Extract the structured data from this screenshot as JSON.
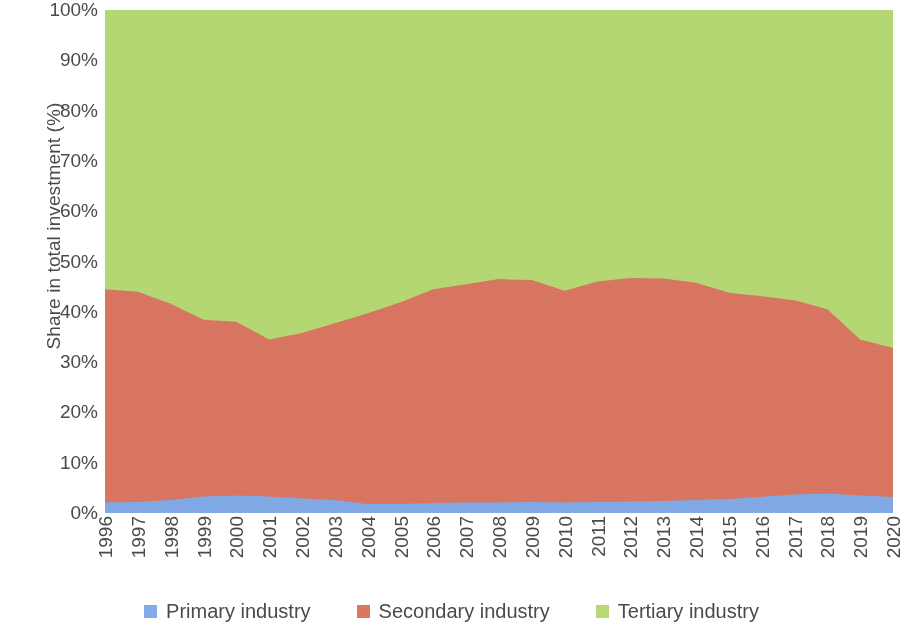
{
  "chart_data": {
    "type": "area",
    "stacked": true,
    "stack_total": 100,
    "title": "",
    "xlabel": "",
    "ylabel": "Share in total investment (%)",
    "ylim": [
      0,
      100
    ],
    "ytick_labels": [
      "0%",
      "10%",
      "20%",
      "30%",
      "40%",
      "50%",
      "60%",
      "70%",
      "80%",
      "90%",
      "100%"
    ],
    "ytick_values": [
      0,
      10,
      20,
      30,
      40,
      50,
      60,
      70,
      80,
      90,
      100
    ],
    "grid": false,
    "legend_position": "bottom",
    "categories": [
      "1996",
      "1997",
      "1998",
      "1999",
      "2000",
      "2001",
      "2002",
      "2003",
      "2004",
      "2005",
      "2006",
      "2007",
      "2008",
      "2009",
      "2010",
      "2011",
      "2012",
      "2013",
      "2014",
      "2015",
      "2016",
      "2017",
      "2018",
      "2019",
      "2020"
    ],
    "series": [
      {
        "name": "Primary industry",
        "color": "#83abe8",
        "values": [
          2.1,
          2.2,
          2.6,
          3.3,
          3.5,
          3.3,
          2.9,
          2.6,
          1.8,
          1.8,
          2.0,
          2.1,
          2.1,
          2.2,
          2.1,
          2.2,
          2.3,
          2.4,
          2.6,
          2.8,
          3.2,
          3.7,
          3.9,
          3.5,
          3.2
        ]
      },
      {
        "name": "Secondary industry",
        "color": "#da7763",
        "values": [
          42.4,
          41.8,
          39.0,
          35.1,
          34.5,
          31.2,
          32.9,
          35.1,
          37.9,
          40.1,
          42.5,
          43.4,
          44.4,
          44.1,
          42.1,
          43.8,
          44.4,
          44.2,
          43.2,
          41.0,
          39.9,
          38.6,
          36.6,
          31.0,
          29.6
        ]
      },
      {
        "name": "Tertiary industry",
        "color": "#b7d974",
        "values": [
          55.5,
          56.0,
          58.4,
          61.6,
          62.0,
          65.5,
          64.2,
          62.3,
          60.3,
          58.1,
          55.5,
          54.5,
          53.5,
          53.7,
          55.8,
          54.0,
          53.3,
          53.4,
          54.2,
          56.2,
          56.9,
          57.7,
          59.5,
          65.5,
          67.2
        ]
      }
    ],
    "cumulative_upper_bounds": {
      "primary_top": [
        2.1,
        2.2,
        2.6,
        3.3,
        3.5,
        3.3,
        2.9,
        2.6,
        1.8,
        1.8,
        2.0,
        2.1,
        2.1,
        2.2,
        2.1,
        2.2,
        2.3,
        2.4,
        2.6,
        2.8,
        3.2,
        3.7,
        3.9,
        3.5,
        3.2
      ],
      "secondary_top": [
        44.5,
        44.0,
        41.6,
        38.4,
        38.0,
        34.5,
        35.8,
        37.7,
        39.7,
        41.9,
        44.5,
        45.5,
        46.5,
        46.3,
        44.2,
        46.0,
        46.7,
        46.6,
        45.8,
        43.8,
        43.1,
        42.3,
        40.5,
        34.5,
        32.8
      ]
    }
  },
  "legend": {
    "items": [
      {
        "label": "Primary industry",
        "color": "#83abe8",
        "swatch_name": "legend-swatch-primary"
      },
      {
        "label": "Secondary industry",
        "color": "#da7763",
        "swatch_name": "legend-swatch-secondary"
      },
      {
        "label": "Tertiary industry",
        "color": "#b7d974",
        "swatch_name": "legend-swatch-tertiary"
      }
    ]
  }
}
